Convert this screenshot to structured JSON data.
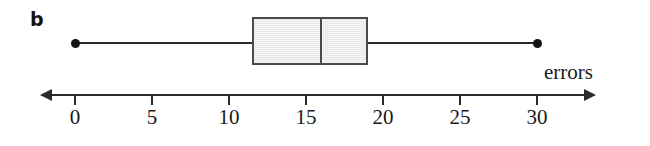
{
  "figure": {
    "panel_letter": "b"
  },
  "chart_data": {
    "type": "boxplot",
    "title": "",
    "xlabel": "errors",
    "ylabel": "",
    "orientation": "horizontal",
    "xlim": [
      -1,
      34
    ],
    "grid": false,
    "legend": null,
    "axis": {
      "label": "errors",
      "ticks": [
        0,
        5,
        10,
        15,
        20,
        25,
        30
      ],
      "tick_labels": [
        "0",
        "5",
        "10",
        "15",
        "20",
        "25",
        "30"
      ],
      "arrow_both_ends": true
    },
    "series": [
      {
        "name": "errors",
        "minimum": 0,
        "q1": 11.5,
        "median": 16,
        "q3": 19,
        "maximum": 30,
        "whisker_low": 0,
        "whisker_high": 30,
        "outliers": [],
        "endpoint_marker": "filled-circle"
      }
    ],
    "colors": {
      "box_fill": "#e2e2e2",
      "box_stroke": "#4a4a4a",
      "whisker": "#2b2b2b",
      "axis": "#2b2b2b",
      "text": "#1a1a1a",
      "background": "#ffffff"
    }
  }
}
